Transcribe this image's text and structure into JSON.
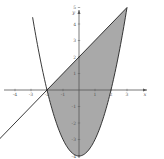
{
  "diagram": {
    "colors": {
      "background": "#ffffff",
      "shade": "#a9a9a9",
      "curve": "#222222",
      "axis": "#555555",
      "tick_label": "#555555"
    },
    "axes": {
      "x_label": "x",
      "y_label": "y",
      "x_ticks": [
        "-4",
        "-3",
        "-2",
        "-1",
        "1",
        "2",
        "3"
      ],
      "y_ticks": [
        "5",
        "4",
        "3",
        "2",
        "1",
        "-1",
        "-2",
        "-3",
        "-4"
      ]
    },
    "curves": [
      {
        "name": "parabola",
        "equation": "y = x^2 - 4"
      },
      {
        "name": "line",
        "equation": "y = x + 2"
      }
    ],
    "intersections": [
      {
        "x": -2,
        "y": 0
      },
      {
        "x": 3,
        "y": 5
      }
    ],
    "shaded_region": "between line (above) and parabola (below) for -2 <= x <= 3"
  }
}
